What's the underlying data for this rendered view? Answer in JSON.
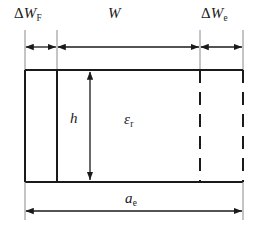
{
  "diagram": {
    "type": "engineering-dimension-drawing",
    "colors": {
      "line": "#1a1a1a",
      "dashed_line": "#1a1a1a",
      "background": "#ffffff",
      "text": "#1a1a1a"
    },
    "labels": {
      "delta_w_f": {
        "symbol": "ΔW",
        "subscript": "F",
        "full": "ΔW_F"
      },
      "w": {
        "symbol": "W",
        "subscript": "",
        "full": "W"
      },
      "delta_w_e": {
        "symbol": "ΔW",
        "subscript": "e",
        "full": "ΔW_e"
      },
      "h": {
        "symbol": "h",
        "subscript": "",
        "full": "h"
      },
      "epsilon_r": {
        "symbol": "ε",
        "subscript": "r",
        "full": "ε_r"
      },
      "a_e": {
        "symbol": "a",
        "subscript": "e",
        "full": "a_e"
      }
    },
    "geometry": {
      "rect_left": 25,
      "rect_right": 243,
      "rect_top": 70,
      "rect_bottom": 182,
      "divider_solid_x": 57,
      "divider_dashed_x": 200,
      "right_edge_style": "dashed",
      "left_edge_style": "solid",
      "top_edge_style": "solid",
      "bottom_edge_style": "solid"
    },
    "dimensions": {
      "top_chain_y": 47,
      "segments": [
        {
          "name": "delta-w-f",
          "from": 25,
          "to": 57,
          "label": "ΔW_F"
        },
        {
          "name": "w",
          "from": 57,
          "to": 200,
          "label": "W"
        },
        {
          "name": "delta-w-e",
          "from": 200,
          "to": 243,
          "label": "ΔW_e"
        }
      ],
      "vertical": {
        "name": "h",
        "x": 90,
        "from": 70,
        "to": 182,
        "label": "h"
      },
      "bottom": {
        "name": "a-e",
        "y": 211,
        "from": 25,
        "to": 243,
        "label": "a_e"
      }
    }
  }
}
